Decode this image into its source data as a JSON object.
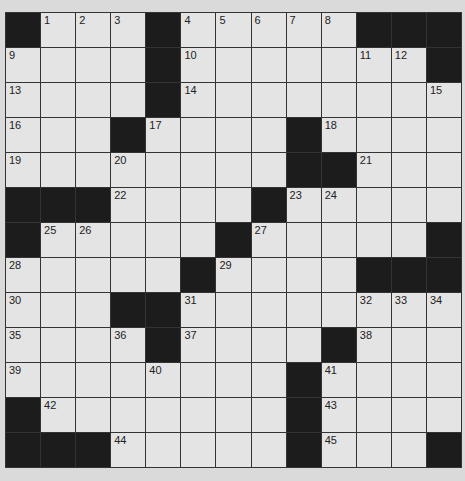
{
  "puzzle": {
    "rows": 13,
    "cols": 13,
    "grid": [
      [
        "#",
        "1",
        "2",
        "3",
        "#",
        "4",
        "5",
        "6",
        "7",
        "8",
        "#",
        "#",
        "#"
      ],
      [
        "9",
        ".",
        ".",
        ".",
        "#",
        "10",
        ".",
        ".",
        ".",
        ".",
        "11",
        "12",
        "#"
      ],
      [
        "13",
        ".",
        ".",
        ".",
        "#",
        "14",
        ".",
        ".",
        ".",
        ".",
        ".",
        ".",
        "15"
      ],
      [
        "16",
        ".",
        ".",
        "#",
        "17",
        ".",
        ".",
        ".",
        "#",
        "18",
        ".",
        ".",
        "."
      ],
      [
        "19",
        ".",
        ".",
        "20",
        ".",
        ".",
        ".",
        ".",
        "#",
        "#",
        "21",
        ".",
        "."
      ],
      [
        "#",
        "#",
        "#",
        "22",
        ".",
        ".",
        ".",
        "#",
        "23",
        "24",
        ".",
        ".",
        "."
      ],
      [
        "#",
        "25",
        "26",
        ".",
        ".",
        ".",
        "#",
        "27",
        ".",
        ".",
        ".",
        ".",
        "#"
      ],
      [
        "28",
        ".",
        ".",
        ".",
        ".",
        "#",
        "29",
        ".",
        ".",
        ".",
        "#",
        "#",
        "#"
      ],
      [
        "30",
        ".",
        ".",
        "#",
        "#",
        "31",
        ".",
        ".",
        ".",
        ".",
        "32",
        "33",
        "34"
      ],
      [
        "35",
        ".",
        ".",
        "36",
        "#",
        "37",
        ".",
        ".",
        ".",
        "#",
        "38",
        ".",
        "."
      ],
      [
        "39",
        ".",
        ".",
        ".",
        "40",
        ".",
        ".",
        ".",
        "#",
        "41",
        ".",
        ".",
        "."
      ],
      [
        "#",
        "42",
        ".",
        ".",
        ".",
        ".",
        ".",
        ".",
        "#",
        "43",
        ".",
        ".",
        "."
      ],
      [
        "#",
        "#",
        "#",
        "44",
        ".",
        ".",
        ".",
        ".",
        "#",
        "45",
        ".",
        ".",
        "#"
      ]
    ]
  },
  "colors": {
    "background": "#dadada",
    "white_cell": "#e4e4e4",
    "black_cell": "#1c1c1c",
    "grid_line": "#333333"
  }
}
